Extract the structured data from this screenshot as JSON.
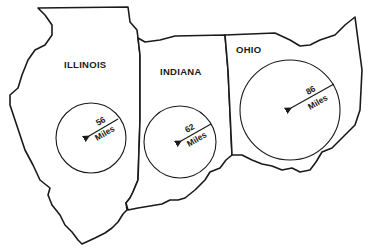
{
  "colors": {
    "ink": "#1a1a1a",
    "background": "#ffffff"
  },
  "states": [
    {
      "name": "ILLINOIS",
      "radius_value": "56",
      "radius_unit": "Miles"
    },
    {
      "name": "INDIANA",
      "radius_value": "62",
      "radius_unit": "Miles"
    },
    {
      "name": "OHIO",
      "radius_value": "86",
      "radius_unit": "Miles"
    }
  ]
}
